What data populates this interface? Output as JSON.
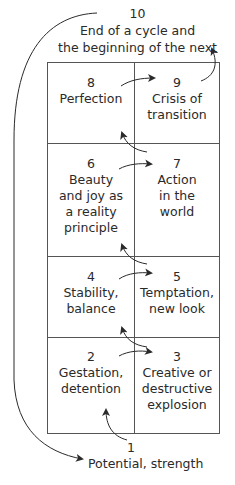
{
  "diagram": {
    "top": {
      "number": "10",
      "label_line1": "End of a cycle and",
      "label_line2": "the beginning of the next"
    },
    "cells": [
      {
        "number": "8",
        "label": "Perfection"
      },
      {
        "number": "9",
        "label": "Crisis of\ntransition"
      },
      {
        "number": "6",
        "label": "Beauty\nand joy as\na reality\nprinciple"
      },
      {
        "number": "7",
        "label": "Action\nin the\nworld"
      },
      {
        "number": "4",
        "label": "Stability,\nbalance"
      },
      {
        "number": "5",
        "label": "Temptation,\nnew look"
      },
      {
        "number": "2",
        "label": "Gestation,\ndetention"
      },
      {
        "number": "3",
        "label": "Creative or\ndestructive\nexplosion"
      }
    ],
    "bottom": {
      "number": "1",
      "label": "Potential, strength"
    },
    "flow": [
      "1→2",
      "2→3",
      "3→4",
      "4→5",
      "5→6",
      "6→7",
      "7→8",
      "8→9",
      "9→10",
      "10→1"
    ],
    "colors": {
      "line": "#555555",
      "text": "#2a2a2a",
      "background": "#ffffff"
    }
  }
}
